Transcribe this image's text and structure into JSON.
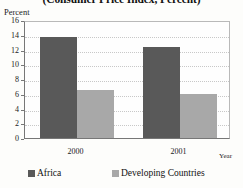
{
  "chart_data": {
    "type": "bar",
    "title": "(Consumer Price Index, Percent)",
    "xlabel": "Year",
    "ylabel": "Percent",
    "categories": [
      "2000",
      "2001"
    ],
    "series": [
      {
        "name": "Africa",
        "values": [
          13.7,
          12.3
        ],
        "color": "#595959"
      },
      {
        "name": "Developing Countries",
        "values": [
          6.5,
          6.0
        ],
        "color": "#a8a8a8"
      }
    ],
    "ylim": [
      0,
      16
    ],
    "ytick_step": 2,
    "yticks": [
      "16",
      "14",
      "12",
      "10",
      "8",
      "6",
      "4",
      "2",
      "0"
    ],
    "grid": true,
    "legend_position": "bottom"
  },
  "legend": {
    "entries": [
      {
        "label": "Africa"
      },
      {
        "label": "Developing Countries"
      }
    ]
  }
}
